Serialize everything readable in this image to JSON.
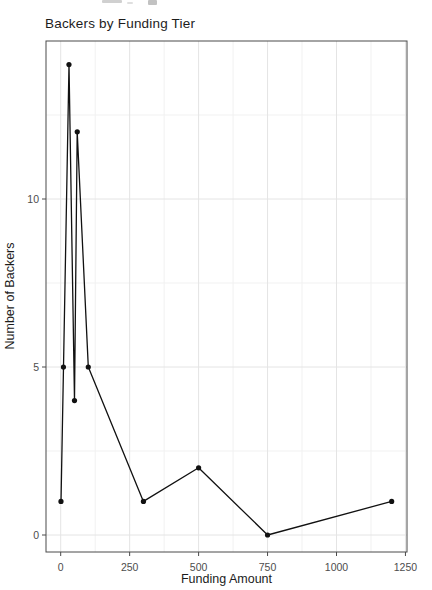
{
  "chart_data": {
    "type": "line",
    "title": "Backers by Funding Tier",
    "xlabel": "Funding Amount",
    "ylabel": "Number of Backers",
    "x": [
      1,
      10,
      30,
      50,
      60,
      100,
      300,
      500,
      750,
      1200
    ],
    "y": [
      1,
      5,
      14,
      4,
      12,
      5,
      1,
      2,
      0,
      1
    ],
    "x_ticks": [
      0,
      250,
      500,
      750,
      1000,
      1250
    ],
    "y_ticks": [
      0,
      5,
      10
    ],
    "x_minor_ticks": [
      125,
      375,
      625,
      875,
      1125
    ],
    "y_minor_ticks": [
      2.5,
      7.5,
      12.5
    ],
    "xlim": [
      -53,
      1256
    ],
    "ylim": [
      -0.5,
      14.7
    ],
    "grid": true,
    "legend_position": "none",
    "marker": "point",
    "colors": {
      "line": "#111111",
      "point": "#111111",
      "grid_major": "#e4e4e4",
      "grid_minor": "#f1f1f1",
      "panel_border": "#4a4a4a",
      "tick_label": "#4d4d4d",
      "axis_title": "#1c1c1c",
      "title": "#1c1c1c",
      "background": "#ffffff"
    }
  }
}
